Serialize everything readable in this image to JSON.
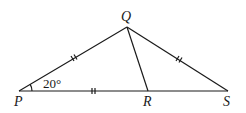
{
  "figure": {
    "points": {
      "P": {
        "label": "P",
        "x": 19,
        "y": 91
      },
      "Q": {
        "label": "Q",
        "x": 127,
        "y": 27
      },
      "R": {
        "label": "R",
        "x": 148,
        "y": 91
      },
      "S": {
        "label": "S",
        "x": 228,
        "y": 91
      }
    },
    "segments": [
      "PQ",
      "QS",
      "PS",
      "QR"
    ],
    "equal_marks": [
      "PQ",
      "QS",
      "PR"
    ],
    "angle": {
      "vertex": "P",
      "label": "20°"
    }
  }
}
